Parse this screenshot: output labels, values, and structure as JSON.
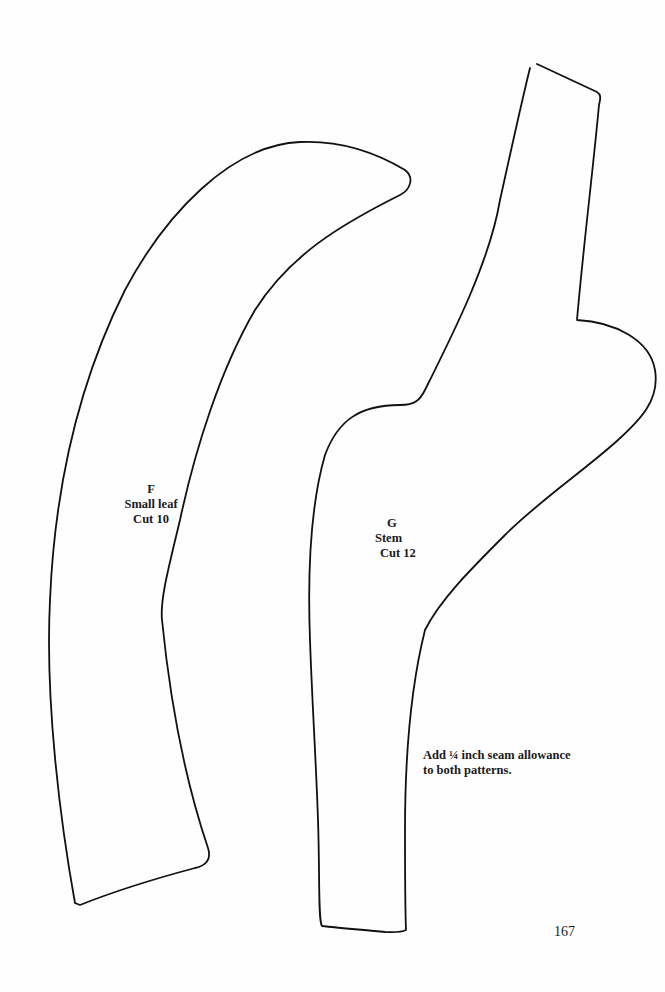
{
  "page": {
    "number": "167",
    "background": "#ffffff",
    "line_color": "#111111"
  },
  "patterns": [
    {
      "id": "F",
      "letter": "F",
      "name": "Small leaf",
      "cut": "Cut 10"
    },
    {
      "id": "G",
      "letter": "G",
      "name": "Stem",
      "cut": "Cut 12"
    }
  ],
  "note": {
    "line1": "Add ¼ inch seam allowance",
    "line2": "to both patterns."
  }
}
